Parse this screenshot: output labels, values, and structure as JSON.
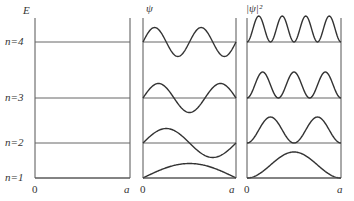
{
  "diagram": {
    "panels": [
      {
        "id": "energy",
        "axis_label": "E",
        "x_start_label": "0",
        "x_end_label": "a",
        "left": 35,
        "right": 130
      },
      {
        "id": "psi",
        "axis_label": "ψ",
        "x_start_label": "0",
        "x_end_label": "a",
        "left": 143,
        "right": 236
      },
      {
        "id": "psi_squared",
        "axis_label": "|ψ|²",
        "x_start_label": "0",
        "x_end_label": "a",
        "left": 247,
        "right": 341
      }
    ],
    "levels": [
      {
        "label": "n=1",
        "n": 1,
        "y": 178
      },
      {
        "label": "n=2",
        "n": 2,
        "y": 143
      },
      {
        "label": "n=3",
        "n": 3,
        "y": 98
      },
      {
        "label": "n=4",
        "n": 4,
        "y": 42
      }
    ],
    "top_y": 18,
    "bottom_y": 178,
    "psi_amplitude": 14.5,
    "psi_squared_height": 26,
    "colors": {
      "line": "#333333",
      "level": "#666666",
      "axis": "#555555",
      "background": "#ffffff"
    }
  }
}
